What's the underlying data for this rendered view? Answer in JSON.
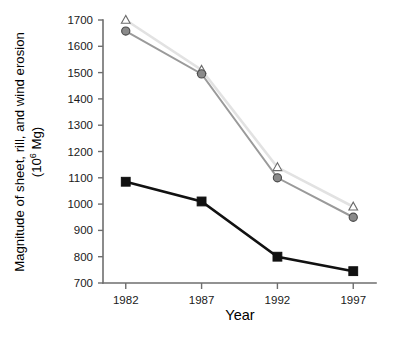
{
  "chart_data": {
    "type": "line",
    "title": "",
    "xlabel": "Year",
    "ylabel_line1": "Magnitude of sheet, rill, and wind erosion",
    "ylabel_line2_pre": "(10",
    "ylabel_line2_sup": "6",
    "ylabel_line2_post": " Mg)",
    "x": [
      1982,
      1987,
      1992,
      1997
    ],
    "xtick_labels": [
      "1982",
      "1987",
      "1992",
      "1997"
    ],
    "ytick_labels": [
      "700",
      "800",
      "900",
      "1000",
      "1100",
      "1200",
      "1300",
      "1400",
      "1500",
      "1600",
      "1700"
    ],
    "ytick_values": [
      700,
      800,
      900,
      1000,
      1100,
      1200,
      1300,
      1400,
      1500,
      1600,
      1700
    ],
    "ylim": [
      700,
      1700
    ],
    "xlim": [
      1980.5,
      1998.5
    ],
    "grid": false,
    "legend": "none",
    "series": [
      {
        "name": "open-triangle-series",
        "marker": "open-triangle",
        "color": "#e2e2e2",
        "marker_color": "#6b6b6b",
        "values": [
          1700,
          1510,
          1140,
          990
        ]
      },
      {
        "name": "filled-circle-series",
        "marker": "filled-circle",
        "color": "#9a9a9a",
        "marker_color": "#8a8a8a",
        "values": [
          1658,
          1495,
          1100,
          950
        ]
      },
      {
        "name": "filled-square-series",
        "marker": "filled-square",
        "color": "#111111",
        "marker_color": "#111111",
        "values": [
          1085,
          1010,
          800,
          745
        ]
      }
    ]
  },
  "caption": {
    "text": ""
  }
}
